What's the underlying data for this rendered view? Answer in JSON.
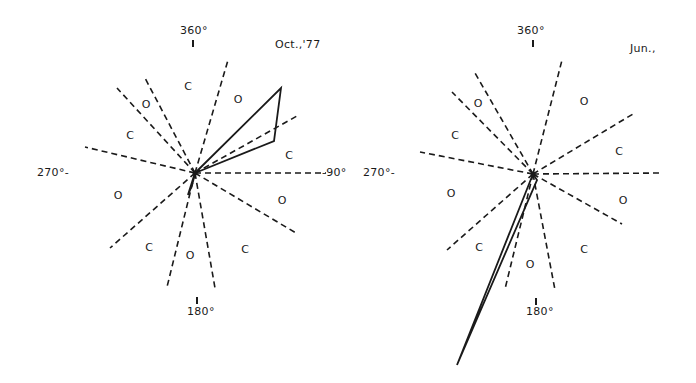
{
  "colors": {
    "ink": "#1a1a1a",
    "background": "#ffffff"
  },
  "panels": [
    {
      "id": "left",
      "title": "Oct.,'77",
      "labels": {
        "north": "360°",
        "east": "-90°",
        "west": "270°-",
        "south": "180°"
      },
      "center": [
        195,
        173
      ],
      "dashed_rays": [
        [
          228,
          60
        ],
        [
          145,
          78
        ],
        [
          117,
          88
        ],
        [
          85,
          147
        ],
        [
          297,
          116
        ],
        [
          326,
          173
        ],
        [
          296,
          233
        ],
        [
          215,
          288
        ],
        [
          167,
          287
        ],
        [
          110,
          248
        ]
      ],
      "sector_labels": [
        {
          "text": "C",
          "x": 188,
          "y": 86
        },
        {
          "text": "O",
          "x": 238,
          "y": 99
        },
        {
          "text": "O",
          "x": 146,
          "y": 104
        },
        {
          "text": "C",
          "x": 130,
          "y": 135
        },
        {
          "text": "C",
          "x": 289,
          "y": 155
        },
        {
          "text": "O",
          "x": 118,
          "y": 195
        },
        {
          "text": "O",
          "x": 282,
          "y": 200
        },
        {
          "text": "C",
          "x": 149,
          "y": 247
        },
        {
          "text": "O",
          "x": 190,
          "y": 255
        },
        {
          "text": "C",
          "x": 245,
          "y": 249
        }
      ],
      "rose_polygon": [
        [
          195,
          173
        ],
        [
          281,
          88
        ],
        [
          274,
          141
        ]
      ],
      "rose_small": [
        [
          195,
          173
        ],
        [
          188,
          195
        ],
        [
          192,
          185
        ]
      ]
    },
    {
      "id": "right",
      "title": "Jun.,",
      "labels": {
        "north": "360°",
        "east": "",
        "west": "270°-",
        "south": "180°"
      },
      "center": [
        533,
        174
      ],
      "dashed_rays": [
        [
          562,
          60
        ],
        [
          475,
          73
        ],
        [
          452,
          92
        ],
        [
          420,
          152
        ],
        [
          633,
          114
        ],
        [
          662,
          173
        ],
        [
          622,
          224
        ],
        [
          555,
          290
        ],
        [
          505,
          289
        ],
        [
          447,
          250
        ]
      ],
      "sector_labels": [
        {
          "text": "O",
          "x": 478,
          "y": 103
        },
        {
          "text": "O",
          "x": 584,
          "y": 101
        },
        {
          "text": "C",
          "x": 455,
          "y": 135
        },
        {
          "text": "C",
          "x": 619,
          "y": 151
        },
        {
          "text": "O",
          "x": 451,
          "y": 193
        },
        {
          "text": "O",
          "x": 623,
          "y": 200
        },
        {
          "text": "C",
          "x": 479,
          "y": 247
        },
        {
          "text": "O",
          "x": 530,
          "y": 264
        },
        {
          "text": "C",
          "x": 584,
          "y": 249
        }
      ],
      "rose_polygon": [
        [
          533,
          174
        ],
        [
          457,
          365
        ],
        [
          537,
          180
        ]
      ]
    }
  ]
}
